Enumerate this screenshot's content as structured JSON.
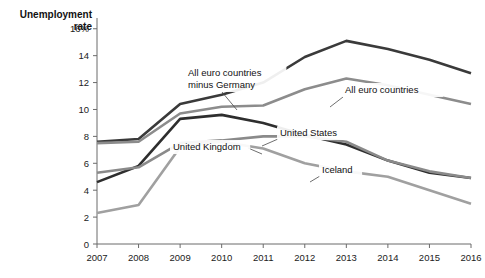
{
  "chart_data": {
    "type": "line",
    "title": "",
    "ylabel": "Unemployment rate",
    "ylabel_line1": "Unemployment",
    "ylabel_line2": "rate",
    "xlabel": "",
    "x": [
      2007,
      2008,
      2009,
      2010,
      2011,
      2012,
      2013,
      2014,
      2015,
      2016
    ],
    "x_tick_labels": [
      "2007",
      "2008",
      "2009",
      "2010",
      "2011",
      "2012",
      "2013",
      "2014",
      "2015",
      "2016"
    ],
    "y_tick_labels": [
      "0",
      "2",
      "4",
      "6",
      "8",
      "10",
      "12",
      "14",
      "16%"
    ],
    "y_ticks": [
      0,
      2,
      4,
      6,
      8,
      10,
      12,
      14,
      16
    ],
    "ylim": [
      0,
      16.8
    ],
    "xlim": [
      2007,
      2016
    ],
    "grid": false,
    "legend_position": "inline-labels",
    "series": [
      {
        "name": "All euro countries minus Germany",
        "label_line1": "All euro countries",
        "label_line2": "minus Germany",
        "color": "#3a3a3a",
        "values": [
          7.6,
          7.8,
          10.4,
          11.1,
          12.0,
          13.9,
          15.1,
          14.5,
          13.7,
          12.7
        ]
      },
      {
        "name": "All euro countries",
        "label_line1": "All euro countries",
        "label_line2": "",
        "color": "#8c8c8c",
        "values": [
          7.5,
          7.6,
          9.7,
          10.2,
          10.3,
          11.5,
          12.3,
          11.8,
          11.1,
          10.4
        ]
      },
      {
        "name": "United States",
        "label_line1": "United States",
        "label_line2": "",
        "color": "#2e2e2e",
        "values": [
          4.6,
          5.8,
          9.3,
          9.6,
          9.0,
          8.1,
          7.4,
          6.2,
          5.3,
          4.9
        ]
      },
      {
        "name": "United Kingdom",
        "label_line1": "United Kingdom",
        "label_line2": "",
        "color": "#8a8a8a",
        "values": [
          5.3,
          5.7,
          7.5,
          7.7,
          8.0,
          8.0,
          7.6,
          6.2,
          5.4,
          4.9
        ]
      },
      {
        "name": "Iceland",
        "label_line1": "Iceland",
        "label_line2": "",
        "color": "#a0a0a0",
        "values": [
          2.3,
          2.9,
          7.2,
          7.6,
          7.1,
          6.0,
          5.4,
          5.0,
          4.0,
          3.0
        ]
      }
    ],
    "annotations": [
      {
        "text": "All euro countries minus Germany",
        "line1": "All euro countries",
        "line2": "minus Germany",
        "label_x": 188,
        "label_y": 76,
        "leader_from_x": 222,
        "leader_from_y": 92,
        "leader_to_x": 237,
        "leader_to_y": 110
      },
      {
        "text": "All euro countries",
        "line1": "All euro countries",
        "line2": "",
        "label_x": 345,
        "label_y": 93,
        "leader_from_x": 343,
        "leader_from_y": 97,
        "leader_to_x": 330,
        "leader_to_y": 107
      },
      {
        "text": "United States",
        "line1": "United States",
        "line2": "",
        "label_x": 280,
        "label_y": 136,
        "leader_from_x": 278,
        "leader_from_y": 139,
        "leader_to_x": 262,
        "leader_to_y": 146
      },
      {
        "text": "United Kingdom",
        "line1": "United Kingdom",
        "line2": "",
        "label_x": 173,
        "label_y": 150,
        "leader_from_x": 248,
        "leader_from_y": 148,
        "leader_to_x": 262,
        "leader_to_y": 154
      },
      {
        "text": "Iceland",
        "line1": "Iceland",
        "line2": "",
        "label_x": 322,
        "label_y": 173,
        "leader_from_x": 320,
        "leader_from_y": 176,
        "leader_to_x": 310,
        "leader_to_y": 182
      }
    ]
  },
  "colors": {
    "background": "#ffffff",
    "axis": "#6b6b6b",
    "text": "#1a1a1a"
  }
}
